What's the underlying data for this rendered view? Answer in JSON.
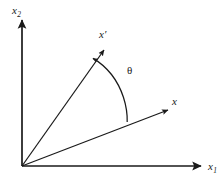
{
  "figure": {
    "background_color": "#ffffff",
    "stroke_color": "#1a1a1a",
    "width": 224,
    "height": 182
  },
  "axes": {
    "origin": {
      "x": 22,
      "y": 166
    },
    "vertical": {
      "name": "x2-axis",
      "label_base": "x",
      "label_subscript": "2",
      "from": {
        "x": 22,
        "y": 166
      },
      "to": {
        "x": 22,
        "y": 18
      },
      "arrowhead": "up"
    },
    "horizontal": {
      "name": "x1-axis",
      "label_base": "x",
      "label_subscript": "1",
      "from": {
        "x": 22,
        "y": 166
      },
      "to": {
        "x": 203,
        "y": 166
      },
      "arrowhead": "right"
    }
  },
  "vectors": [
    {
      "name": "x-prime-vector",
      "label": "x′",
      "from": {
        "x": 22,
        "y": 166
      },
      "to": {
        "x": 106,
        "y": 47
      },
      "angle_degrees": 54.8,
      "arrowhead": "end"
    },
    {
      "name": "x-vector",
      "label": "x⃗",
      "from": {
        "x": 22,
        "y": 166
      },
      "to": {
        "x": 170,
        "y": 109
      },
      "angle_degrees": 21.1,
      "arrowhead": "end"
    }
  ],
  "angle_arc": {
    "name": "theta-arc",
    "label": "θ",
    "radius": 67,
    "from_vector": "x-vector",
    "to_vector": "x-prime-vector",
    "arrowhead": "at-x-prime-end",
    "sweep_degrees": 33.7
  }
}
